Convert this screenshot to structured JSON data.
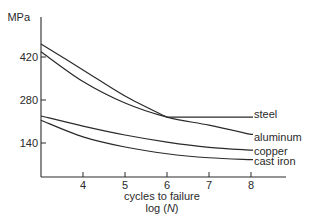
{
  "chart_data": {
    "type": "line",
    "title": "",
    "xlabel": "cycles to failure",
    "xlabel_line2_prefix": "log (",
    "xlabel_line2_var": "N",
    "xlabel_line2_suffix": ")",
    "ylabel": "MPa",
    "xlim": [
      3,
      8.85
    ],
    "ylim": [
      30,
      490
    ],
    "x_ticks": [
      4,
      5,
      6,
      7,
      8
    ],
    "x_tick_labels": [
      "4",
      "5",
      "6",
      "7",
      "8"
    ],
    "y_ticks": [
      140,
      280,
      420
    ],
    "y_tick_labels": [
      "140",
      "280",
      "420"
    ],
    "grid": false,
    "legend": "inline labels at right end of each curve",
    "series": [
      {
        "name": "steel",
        "x": [
          3,
          4,
          5,
          6,
          7,
          8
        ],
        "values": [
          462,
          378,
          293,
          224,
          224,
          224
        ]
      },
      {
        "name": "aluminum",
        "x": [
          3,
          4,
          5,
          6,
          7,
          8
        ],
        "values": [
          437,
          340,
          270,
          224,
          198,
          168
        ]
      },
      {
        "name": "copper",
        "x": [
          3,
          4,
          5,
          6,
          7,
          8
        ],
        "values": [
          228,
          195,
          166,
          143,
          126,
          117
        ]
      },
      {
        "name": "cast iron",
        "x": [
          3,
          4,
          5,
          6,
          7,
          8
        ],
        "values": [
          214,
          160,
          127,
          105,
          92,
          86
        ]
      }
    ]
  },
  "colors": {
    "line": "#2a2a2a",
    "background": "#ffffff"
  }
}
